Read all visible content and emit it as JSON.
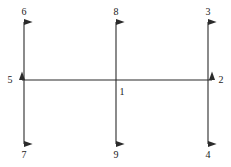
{
  "diagram": {
    "background_color": "#ffffff",
    "line_color": "#2b2b2b",
    "label_color": "#1a1a1a",
    "line_width": 1.1,
    "canvas": {
      "width": 231,
      "height": 167
    },
    "geometry": {
      "vertical_x": [
        24,
        116,
        208
      ],
      "horizontal_y": 80,
      "vertical_top_y": 22,
      "vertical_bottom_y": 144,
      "horizontal_left_x": 22,
      "horizontal_right_x": 212
    },
    "axes": [
      {
        "name": "left-vertical-axis",
        "orientation": "vertical",
        "x": 24,
        "from_y": 22,
        "to_y": 144,
        "arrow_start": true,
        "arrow_end": true,
        "start_label": "6",
        "end_label": "7"
      },
      {
        "name": "center-vertical-axis",
        "orientation": "vertical",
        "x": 116,
        "from_y": 22,
        "to_y": 144,
        "arrow_start": true,
        "arrow_end": true,
        "start_label": "8",
        "end_label": "9"
      },
      {
        "name": "right-vertical-axis",
        "orientation": "vertical",
        "x": 208,
        "from_y": 22,
        "to_y": 144,
        "arrow_start": true,
        "arrow_end": true,
        "start_label": "3",
        "end_label": "4"
      },
      {
        "name": "horizontal-axis",
        "orientation": "horizontal",
        "y": 80,
        "from_x": 22,
        "to_x": 212,
        "arrow_start": true,
        "arrow_end": true,
        "start_label": "5",
        "end_label": "2"
      }
    ],
    "labels": [
      {
        "id": "label-6",
        "text": "6",
        "x": 24,
        "y": 12,
        "position": "top-left",
        "anchor": "center"
      },
      {
        "id": "label-8",
        "text": "8",
        "x": 116,
        "y": 12,
        "position": "top-center",
        "anchor": "center"
      },
      {
        "id": "label-3",
        "text": "3",
        "x": 208,
        "y": 12,
        "position": "top-right",
        "anchor": "center"
      },
      {
        "id": "label-5",
        "text": "5",
        "x": 10,
        "y": 80,
        "position": "middle-left",
        "anchor": "center"
      },
      {
        "id": "label-1",
        "text": "1",
        "x": 122,
        "y": 92,
        "position": "center",
        "anchor": "center"
      },
      {
        "id": "label-2",
        "text": "2",
        "x": 221,
        "y": 80,
        "position": "middle-right",
        "anchor": "center"
      },
      {
        "id": "label-7",
        "text": "7",
        "x": 24,
        "y": 155,
        "position": "bottom-left",
        "anchor": "center"
      },
      {
        "id": "label-9",
        "text": "9",
        "x": 116,
        "y": 155,
        "position": "bottom-center",
        "anchor": "center"
      },
      {
        "id": "label-4",
        "text": "4",
        "x": 208,
        "y": 155,
        "position": "bottom-right",
        "anchor": "center"
      }
    ]
  }
}
